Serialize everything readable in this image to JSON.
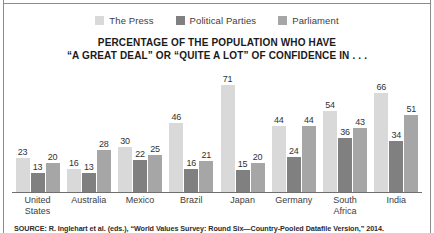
{
  "chart_data": {
    "type": "bar",
    "title": "PERCENTAGE OF THE POPULATION WHO HAVE “A GREAT DEAL” OR “QUITE A LOT” OF CONFIDENCE IN . . .",
    "title_lines": [
      "PERCENTAGE OF THE POPULATION WHO HAVE",
      "“A GREAT DEAL” OR “QUITE A LOT” OF CONFIDENCE IN . . ."
    ],
    "xlabel": "",
    "ylabel": "",
    "ylim": [
      0,
      75
    ],
    "grid": false,
    "legend_position": "top-center",
    "categories": [
      "United States",
      "Australia",
      "Mexico",
      "Brazil",
      "Japan",
      "Germany",
      "South Africa",
      "India"
    ],
    "category_lines": [
      [
        "United",
        "States"
      ],
      [
        "Australia"
      ],
      [
        "Mexico"
      ],
      [
        "Brazil"
      ],
      [
        "Japan"
      ],
      [
        "Germany"
      ],
      [
        "South",
        "Africa"
      ],
      [
        "India"
      ]
    ],
    "series": [
      {
        "name": "The Press",
        "color": "#d9d9d9",
        "values": [
          23,
          16,
          30,
          46,
          71,
          44,
          54,
          66
        ]
      },
      {
        "name": "Political Parties",
        "color": "#808080",
        "values": [
          13,
          13,
          22,
          16,
          15,
          24,
          36,
          34
        ]
      },
      {
        "name": "Parliament",
        "color": "#a6a6a6",
        "values": [
          20,
          28,
          25,
          21,
          20,
          44,
          43,
          51
        ]
      }
    ],
    "source": "SOURCE: R. Inglehart et al. (eds.), “World Values Survey: Round Six—Country-Pooled Datafile Version,” 2014."
  },
  "colors": {
    "the_press": "#d9d9d9",
    "political_parties": "#808080",
    "parliament": "#a6a6a6",
    "axis": "#6f6f6f",
    "frame": "#8c8c8c",
    "text": "#3d3d3d",
    "title_text": "#1a1a1a"
  }
}
